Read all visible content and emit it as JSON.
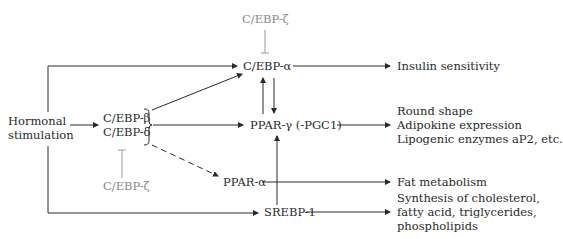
{
  "nodes": {
    "hormonal": {
      "line1": "Hormonal",
      "line2": "stimulation"
    },
    "cebp_beta": "C/EBP-β",
    "cebp_delta": "C/EBP-δ",
    "cebp_zeta_top": "C/EBP-ζ",
    "cebp_zeta_bottom": "C/EBP-ζ",
    "cebp_alpha": "C/EBP-α",
    "ppar_gamma": "PPAR-γ (-PGC1)",
    "ppar_alpha": "PPAR-α",
    "srebp1": "SREBP-1"
  },
  "outcomes": {
    "insulin": "Insulin sensitivity",
    "ppar_gamma_effects": [
      "Round shape",
      "Adipokine expression",
      "Lipogenic enzymes aP2, etc."
    ],
    "fat": "Fat metabolism",
    "srebp_effects": [
      "Synthesis of cholesterol,",
      "fatty acid, triglycerides,",
      "phospholipids"
    ]
  },
  "colors": {
    "line": "#2a2a2a",
    "inhibitor": "#9a9a9a"
  }
}
